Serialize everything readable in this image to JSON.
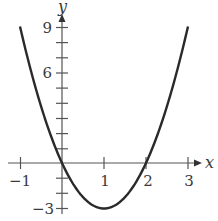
{
  "chart_data": {
    "type": "line",
    "title": "",
    "xlabel": "x",
    "ylabel": "y",
    "xlim": [
      -1,
      3
    ],
    "ylim": [
      -3,
      9
    ],
    "grid": false,
    "x_ticks": [
      -1,
      0,
      1,
      2,
      3
    ],
    "x_tick_labels": [
      "−1",
      "1",
      "2",
      "3"
    ],
    "x_tick_label_values": [
      -1,
      1,
      2,
      3
    ],
    "y_ticks": [
      -3,
      -2,
      -1,
      0,
      1,
      2,
      3,
      4,
      5,
      6,
      7,
      8,
      9
    ],
    "y_tick_labels": [
      "−3",
      "6",
      "9"
    ],
    "y_tick_label_values": [
      -3,
      6,
      9
    ],
    "series": [
      {
        "name": "y = 3x^2 - 6x",
        "x": [
          -1,
          -0.5,
          0,
          0.5,
          1,
          1.5,
          2,
          2.5,
          3
        ],
        "values": [
          9,
          3.75,
          0,
          -2.25,
          -3,
          -2.25,
          0,
          3.75,
          9
        ]
      }
    ],
    "colors": {
      "curve": "#2a2a2a",
      "axis": "#555555",
      "text": "#3a3a3a"
    }
  },
  "labels": {
    "x_axis": "x",
    "y_axis": "y",
    "xtick_m1": "−1",
    "xtick_1": "1",
    "xtick_2": "2",
    "xtick_3": "3",
    "ytick_9": "9",
    "ytick_6": "6",
    "ytick_m3": "−3"
  }
}
